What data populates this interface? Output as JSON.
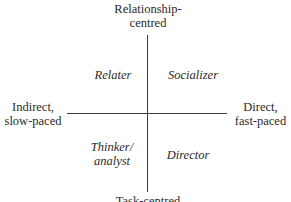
{
  "axes": {
    "top": [
      "Relationship-",
      "centred"
    ],
    "bottom": "Task-centred",
    "left": [
      "Indirect,",
      "slow-paced"
    ],
    "right": [
      "Direct,",
      "fast-paced"
    ]
  },
  "quadrants": {
    "top_left": "Relater",
    "top_right": "Socializer",
    "bottom_left": [
      "Thinker/",
      "analyst"
    ],
    "bottom_right": "Director"
  }
}
